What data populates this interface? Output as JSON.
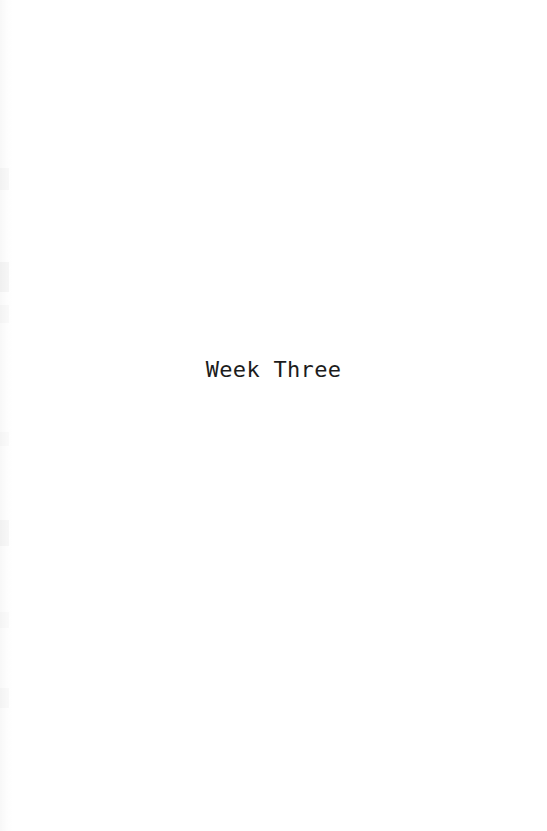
{
  "page": {
    "kind": "book-section-divider-page",
    "width": 547,
    "height": 831,
    "background_color": "#ffffff",
    "text_color": "#1c1c1c"
  },
  "content": {
    "section_title": "Week Three"
  }
}
